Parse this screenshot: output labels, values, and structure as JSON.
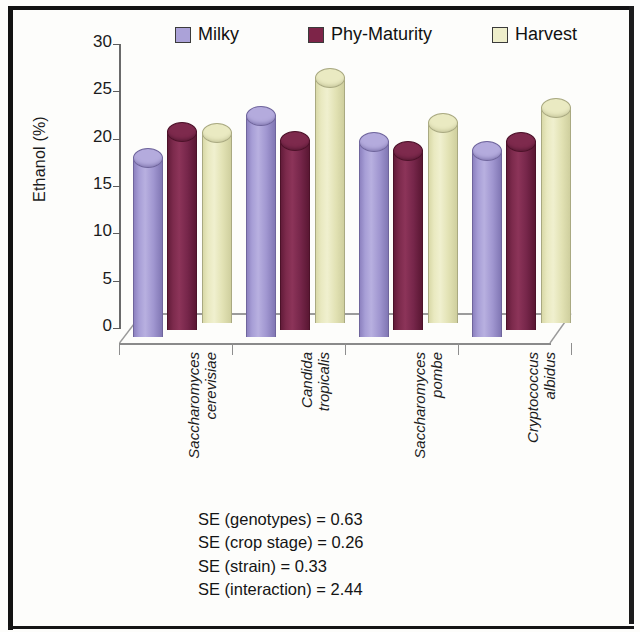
{
  "chart_data": {
    "type": "bar",
    "title": "",
    "subtitle": "",
    "xlabel": "",
    "ylabel": "Ethanol (%)",
    "ylim": [
      0,
      30
    ],
    "yticks": [
      30,
      25,
      20,
      15,
      10,
      5,
      0
    ],
    "grid": false,
    "legend_position": "top",
    "three_d": true,
    "bar_shape": "cylinder",
    "categories": [
      "Saccharomyces cerevisiae",
      "Candida tropicalis",
      "Saccharomyces pombe",
      "Cryptococcus albidus"
    ],
    "category_lines": [
      [
        "Saccharomyces",
        "cerevisiae"
      ],
      [
        "Candida",
        "tropicalis"
      ],
      [
        "Saccharomyces",
        "pombe"
      ],
      [
        "Cryptococcus",
        "albidus"
      ]
    ],
    "series": [
      {
        "name": "Milky",
        "color": "#aba2d8",
        "values": [
          19.0,
          23.5,
          20.7,
          19.8
        ]
      },
      {
        "name": "Phy-Maturity",
        "color": "#7d2448",
        "values": [
          21.0,
          20.1,
          19.0,
          20.0
        ]
      },
      {
        "name": "Harvest",
        "color": "#eeeecb",
        "values": [
          20.2,
          26.0,
          21.2,
          22.8
        ]
      }
    ],
    "annotations": [
      "SE (genotypes) = 0.63",
      "SE (crop stage) = 0.26",
      "SE (strain) = 0.33",
      "SE (interaction) = 2.44"
    ]
  },
  "legend": {
    "items": [
      {
        "label": "Milky",
        "icon": "legend-swatch-milky"
      },
      {
        "label": "Phy-Maturity",
        "icon": "legend-swatch-phy-maturity"
      },
      {
        "label": "Harvest",
        "icon": "legend-swatch-harvest"
      }
    ]
  },
  "axis": {
    "y_title": "Ethanol (%)",
    "y_tick_labels": [
      "30",
      "25",
      "20",
      "15",
      "10",
      "5",
      "0"
    ]
  },
  "footnotes": {
    "genotypes": "SE (genotypes) = 0.63",
    "crop_stage": "SE (crop stage) = 0.26",
    "strain": "SE (strain) = 0.33",
    "interaction": "SE (interaction) = 2.44"
  }
}
